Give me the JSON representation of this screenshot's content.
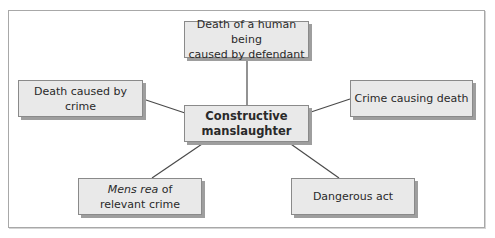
{
  "diagram": {
    "type": "concept-map",
    "center": {
      "id": "center",
      "line1": "Constructive",
      "line2": "manslaughter"
    },
    "nodes": [
      {
        "id": "top",
        "line1": "Death of a human being",
        "line2": "caused by defendant"
      },
      {
        "id": "left",
        "line1": "Death caused by crime"
      },
      {
        "id": "right",
        "line1": "Crime causing death"
      },
      {
        "id": "bottom-left",
        "line1_italic": "Mens rea",
        "line1_rest": " of",
        "line2": "relevant crime"
      },
      {
        "id": "bottom-right",
        "line1": "Dangerous act"
      }
    ],
    "edges": [
      {
        "from": "center",
        "to": "top"
      },
      {
        "from": "center",
        "to": "left"
      },
      {
        "from": "center",
        "to": "right"
      },
      {
        "from": "center",
        "to": "bottom-left"
      },
      {
        "from": "center",
        "to": "bottom-right"
      }
    ],
    "colors": {
      "box_fill": "#e9e9e9",
      "box_border": "#8a8a8a",
      "box_shadow": "#9e9e9e",
      "connector": "#4a4a4a",
      "frame_border": "#a8a8a8"
    }
  }
}
